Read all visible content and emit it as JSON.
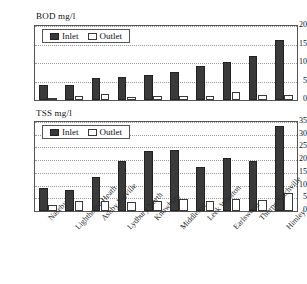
{
  "chart_data": [
    {
      "type": "bar",
      "title": "BOD  mg/l",
      "xlabel": "",
      "ylabel": "",
      "ylim": [
        0,
        20
      ],
      "yticks": [
        0,
        5,
        10,
        15,
        20
      ],
      "grid": true,
      "legend_position": "top-left",
      "categories": [
        "Naseby",
        "Lighthorne Heath",
        "Ashby Folville",
        "Lydbury North",
        "Knowbury",
        "Middleton",
        "Leek Wootton",
        "Earlswood",
        "Thorpe Satchville",
        "Himley"
      ],
      "series": [
        {
          "name": "Inlet",
          "color": "#3a3a3a",
          "values": [
            4.0,
            4.0,
            6.0,
            6.3,
            6.7,
            7.5,
            9.2,
            10.2,
            11.8,
            16.3
          ]
        },
        {
          "name": "Outlet",
          "color": "#ffffff",
          "values": [
            0.6,
            1.1,
            1.5,
            0.9,
            1.1,
            1.2,
            1.2,
            2.2,
            1.4,
            1.4
          ]
        }
      ]
    },
    {
      "type": "bar",
      "title": "TSS mg/l",
      "xlabel": "",
      "ylabel": "",
      "ylim": [
        0,
        35
      ],
      "yticks": [
        0,
        5,
        10,
        15,
        20,
        25,
        30,
        35
      ],
      "grid": true,
      "legend_position": "top-left",
      "categories": [
        "Naseby",
        "Lighthorne Heath",
        "Ashby Folville",
        "Lydbury North",
        "Knowbury",
        "Middleton",
        "Leek Wootton",
        "Earlswood",
        "Thorpe Satchville",
        "Himley"
      ],
      "series": [
        {
          "name": "Inlet",
          "color": "#3a3a3a",
          "values": [
            9.0,
            8.3,
            13.3,
            19.7,
            23.7,
            24.0,
            17.3,
            20.7,
            19.8,
            33.3
          ]
        },
        {
          "name": "Outlet",
          "color": "#ffffff",
          "values": [
            2.3,
            4.0,
            3.8,
            3.6,
            3.8,
            4.7,
            3.8,
            4.7,
            4.3,
            7.2
          ]
        }
      ]
    }
  ]
}
